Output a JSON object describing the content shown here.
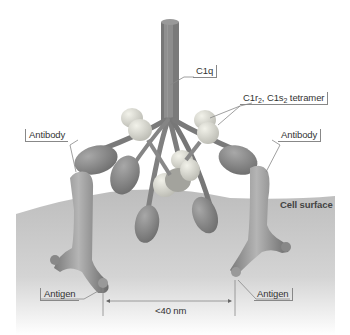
{
  "diagram": {
    "type": "biology-illustration",
    "labels": {
      "c1q": "C1q",
      "tetramer_prefix": "C1r",
      "tetramer_sub1": "2",
      "tetramer_mid": ", C1s",
      "tetramer_sub2": "2",
      "tetramer_suffix": " tetramer",
      "antibody_left": "Antibody",
      "antibody_right": "Antibody",
      "cell_surface": "Cell surface",
      "antigen_left": "Antigen",
      "antigen_right": "Antigen",
      "distance": "<40 nm"
    },
    "colors": {
      "protein": "#8c8c8c",
      "protein_dark": "#6e6e6e",
      "protein_light": "#d9d9cf",
      "cell_surface": "#c8c8c8",
      "background": "#ffffff",
      "leader_lines": "#888888"
    }
  }
}
